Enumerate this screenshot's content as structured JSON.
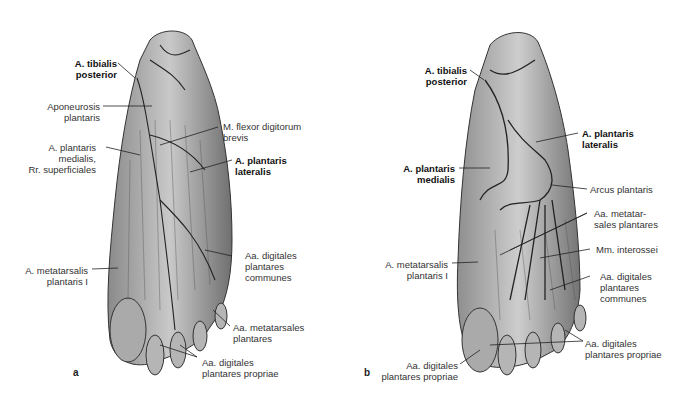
{
  "figure": {
    "panels": [
      {
        "letter": "a",
        "labels": {
          "tibialis_posterior": [
            "A. tibialis",
            "posterior"
          ],
          "aponeurosis": [
            "Aponeurosis",
            "plantaris"
          ],
          "flexor": [
            "M. flexor digitorum",
            "brevis"
          ],
          "plantaris_medialis": [
            "A. plantaris",
            "medialis,",
            "Rr. superficiales"
          ],
          "plantaris_lateralis": [
            "A. plantaris",
            "lateralis"
          ],
          "metatarsalis": [
            "A. metatarsalis",
            "plantaris I"
          ],
          "digitales_communes": [
            "Aa. digitales",
            "plantares",
            "communes"
          ],
          "metatarsales": [
            "Aa. metatarsales",
            "plantares"
          ],
          "digitales_propriae": [
            "Aa. digitales",
            "plantares propriae"
          ]
        }
      },
      {
        "letter": "b",
        "labels": {
          "tibialis_posterior": [
            "A. tibialis",
            "posterior"
          ],
          "plantaris_lateralis": [
            "A. plantaris",
            "lateralis"
          ],
          "plantaris_medialis": [
            "A. plantaris",
            "medialis"
          ],
          "arcus": [
            "Arcus plantaris"
          ],
          "metatarsales": [
            "Aa. metatar-",
            "sales plantares"
          ],
          "interossei": [
            "Mm. interossei"
          ],
          "metatarsalis": [
            "A. metatarsalis",
            "plantaris I"
          ],
          "digitales_communes": [
            "Aa. digitales",
            "plantares",
            "communes"
          ],
          "digitales_propriae_r": [
            "Aa. digitales",
            "plantares propriae"
          ],
          "digitales_propriae_l": [
            "Aa. digitales",
            "plantares propriae"
          ]
        }
      }
    ]
  }
}
